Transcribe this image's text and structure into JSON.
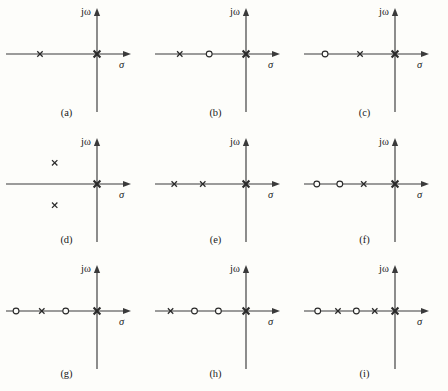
{
  "figure": {
    "background_color": "#fdfdfa",
    "ink_color": "#2a2a2a",
    "axis_color": "#3a3a3a",
    "axis_labels": {
      "imaginary": "jω",
      "real": "σ"
    },
    "marker_legend": {
      "pole": "×",
      "zero": "○"
    },
    "panels": [
      {
        "id": "a",
        "caption": "(a)",
        "poles": [
          {
            "sigma": -0.62,
            "omega": 0,
            "symbol": "x",
            "weight": "normal"
          },
          {
            "sigma": 0,
            "omega": 0,
            "symbol": "x",
            "weight": "heavy"
          }
        ],
        "zeros": []
      },
      {
        "id": "b",
        "caption": "(b)",
        "poles": [
          {
            "sigma": -0.72,
            "omega": 0,
            "symbol": "x",
            "weight": "normal"
          },
          {
            "sigma": 0,
            "omega": 0,
            "symbol": "x",
            "weight": "heavy"
          }
        ],
        "zeros": [
          {
            "sigma": -0.4,
            "omega": 0,
            "symbol": "o"
          }
        ]
      },
      {
        "id": "c",
        "caption": "(c)",
        "poles": [
          {
            "sigma": -0.38,
            "omega": 0,
            "symbol": "x",
            "weight": "normal"
          },
          {
            "sigma": 0,
            "omega": 0,
            "symbol": "x",
            "weight": "heavy"
          }
        ],
        "zeros": [
          {
            "sigma": -0.76,
            "omega": 0,
            "symbol": "o"
          }
        ]
      },
      {
        "id": "d",
        "caption": "(d)",
        "poles": [
          {
            "sigma": -0.46,
            "omega": 0.46,
            "symbol": "x",
            "weight": "normal"
          },
          {
            "sigma": -0.46,
            "omega": -0.46,
            "symbol": "x",
            "weight": "normal"
          },
          {
            "sigma": 0,
            "omega": 0,
            "symbol": "x",
            "weight": "heavy"
          }
        ],
        "zeros": []
      },
      {
        "id": "e",
        "caption": "(e)",
        "poles": [
          {
            "sigma": -0.78,
            "omega": 0,
            "symbol": "x",
            "weight": "normal"
          },
          {
            "sigma": -0.47,
            "omega": 0,
            "symbol": "x",
            "weight": "normal"
          },
          {
            "sigma": 0,
            "omega": 0,
            "symbol": "x",
            "weight": "heavy"
          }
        ],
        "zeros": []
      },
      {
        "id": "f",
        "caption": "(f)",
        "poles": [
          {
            "sigma": -0.34,
            "omega": 0,
            "symbol": "x",
            "weight": "normal"
          },
          {
            "sigma": 0,
            "omega": 0,
            "symbol": "x",
            "weight": "heavy"
          }
        ],
        "zeros": [
          {
            "sigma": -0.85,
            "omega": 0,
            "symbol": "o"
          },
          {
            "sigma": -0.6,
            "omega": 0,
            "symbol": "o"
          }
        ]
      },
      {
        "id": "g",
        "caption": "(g)",
        "poles": [
          {
            "sigma": -0.6,
            "omega": 0,
            "symbol": "x",
            "weight": "normal"
          },
          {
            "sigma": 0,
            "omega": 0,
            "symbol": "x",
            "weight": "heavy"
          }
        ],
        "zeros": [
          {
            "sigma": -0.88,
            "omega": 0,
            "symbol": "o"
          },
          {
            "sigma": -0.34,
            "omega": 0,
            "symbol": "o"
          }
        ]
      },
      {
        "id": "h",
        "caption": "(h)",
        "poles": [
          {
            "sigma": -0.82,
            "omega": 0,
            "symbol": "x",
            "weight": "normal"
          },
          {
            "sigma": 0,
            "omega": 0,
            "symbol": "x",
            "weight": "heavy"
          }
        ],
        "zeros": [
          {
            "sigma": -0.56,
            "omega": 0,
            "symbol": "o"
          },
          {
            "sigma": -0.3,
            "omega": 0,
            "symbol": "o"
          }
        ]
      },
      {
        "id": "i",
        "caption": "(i)",
        "poles": [
          {
            "sigma": -0.62,
            "omega": 0,
            "symbol": "x",
            "weight": "normal"
          },
          {
            "sigma": -0.22,
            "omega": 0,
            "symbol": "x",
            "weight": "normal"
          },
          {
            "sigma": 0,
            "omega": 0,
            "symbol": "x",
            "weight": "heavy"
          }
        ],
        "zeros": [
          {
            "sigma": -0.84,
            "omega": 0,
            "symbol": "o"
          },
          {
            "sigma": -0.42,
            "omega": 0,
            "symbol": "o"
          }
        ]
      }
    ]
  }
}
